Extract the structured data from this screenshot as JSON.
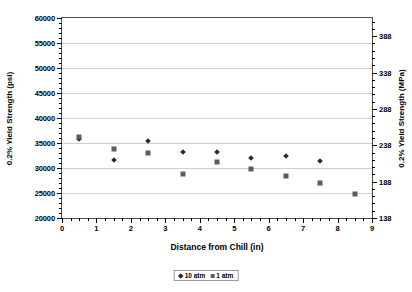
{
  "chart_data": {
    "type": "scatter",
    "title": "",
    "xlabel": "Distance from Chill (in)",
    "ylabel": "0.2% Yield Strength (psi)",
    "ylabel_right": "0.2% Yield Strength (MPa)",
    "xlim": [
      0,
      9
    ],
    "ylim": [
      20000,
      60000
    ],
    "ylim_right": [
      138,
      413
    ],
    "xticks": [
      "0",
      "1",
      "2",
      "3",
      "4",
      "5",
      "6",
      "7",
      "8",
      "9"
    ],
    "yticks": [
      "20000",
      "25000",
      "30000",
      "35000",
      "40000",
      "45000",
      "50000",
      "55000",
      "60000"
    ],
    "yticks_right": [
      "138",
      "188",
      "238",
      "288",
      "338",
      "388"
    ],
    "grid": true,
    "legend_position": "bottom",
    "series": [
      {
        "name": "10 atm",
        "marker": "diamond",
        "color": "#2b2b2b",
        "points": [
          {
            "x": 0.5,
            "y": 35900
          },
          {
            "x": 1.5,
            "y": 31700
          },
          {
            "x": 2.5,
            "y": 35400
          },
          {
            "x": 3.5,
            "y": 33200
          },
          {
            "x": 4.5,
            "y": 33300
          },
          {
            "x": 5.5,
            "y": 32000
          },
          {
            "x": 6.5,
            "y": 32400
          },
          {
            "x": 7.5,
            "y": 31500
          }
        ]
      },
      {
        "name": "1 atm",
        "marker": "square",
        "color": "#5c5c5c",
        "points": [
          {
            "x": 0.5,
            "y": 36300
          },
          {
            "x": 1.5,
            "y": 33800
          },
          {
            "x": 2.5,
            "y": 33000
          },
          {
            "x": 3.5,
            "y": 28800
          },
          {
            "x": 4.5,
            "y": 31200
          },
          {
            "x": 5.5,
            "y": 29900
          },
          {
            "x": 6.5,
            "y": 28400
          },
          {
            "x": 7.5,
            "y": 27000
          },
          {
            "x": 8.5,
            "y": 24800
          }
        ]
      }
    ]
  }
}
